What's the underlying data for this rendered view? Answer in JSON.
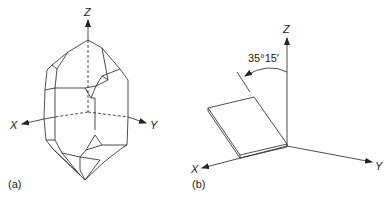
{
  "figure": {
    "panel_a": {
      "label": "(a)",
      "axes": {
        "x": "X",
        "y": "Y",
        "z": "Z"
      },
      "description": "crystal"
    },
    "panel_b": {
      "label": "(b)",
      "axes": {
        "x": "X",
        "y": "Y",
        "z": "Z"
      },
      "angle_label": "35°15′",
      "description": "plate"
    },
    "colors": {
      "line": "#222222",
      "background": "#ffffff"
    }
  }
}
